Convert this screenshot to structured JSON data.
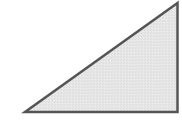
{
  "diagram": {
    "shape": "right-triangle",
    "fill_color": "#e4e4e4",
    "stroke_color": "#555555",
    "stroke_width": 2.5,
    "vertices": {
      "top_right": [
        177.5,
        3
      ],
      "bottom_left": [
        25,
        112
      ],
      "bottom_right": [
        177.5,
        112
      ]
    },
    "right_angle_corner": "bottom-right"
  }
}
